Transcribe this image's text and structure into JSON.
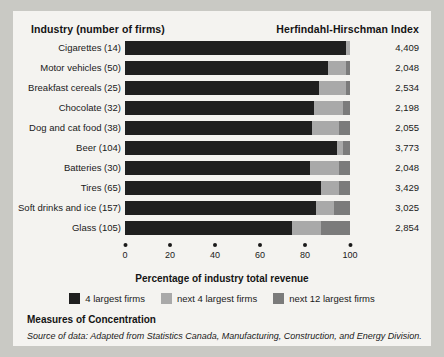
{
  "header": {
    "industry_label": "Industry (number of firms)",
    "hhi_label": "Herfindahl-Hirschman Index"
  },
  "axis": {
    "title": "Percentage of industry total revenue",
    "ticks": [
      "0",
      "20",
      "40",
      "60",
      "80",
      "100"
    ]
  },
  "legend": [
    {
      "label": "4 largest firms",
      "color": "#1f1f1f"
    },
    {
      "label": "next 4 largest firms",
      "color": "#a9a9a9"
    },
    {
      "label": "next 12 largest firms",
      "color": "#7b7b7b"
    }
  ],
  "footer": {
    "caption": "Measures of Concentration",
    "source": "Source of data: Adapted from Statistics Canada, Manufacturing, Construction, and Energy Division."
  },
  "chart_data": {
    "type": "bar",
    "title": "Measures of Concentration",
    "xlabel": "Percentage of industry total revenue",
    "ylabel": "Industry (number of firms)",
    "xlim": [
      0,
      100
    ],
    "grid": false,
    "orientation": "horizontal",
    "stacked": true,
    "legend_position": "bottom",
    "categories": [
      "Cigarettes (14)",
      "Motor vehicles (50)",
      "Breakfast cereals (25)",
      "Chocolate (32)",
      "Dog and cat food (38)",
      "Beer (104)",
      "Batteries (30)",
      "Tires (65)",
      "Soft drinks and ice (157)",
      "Glass (105)"
    ],
    "series": [
      {
        "name": "4 largest firms",
        "values": [
          98,
          90,
          86,
          84,
          83,
          94,
          82,
          87,
          85,
          74
        ]
      },
      {
        "name": "next 4 largest firms",
        "values": [
          2,
          8,
          12,
          13,
          12,
          3,
          13,
          8,
          8,
          13
        ]
      },
      {
        "name": "next 12 largest firms",
        "values": [
          0,
          2,
          2,
          3,
          5,
          3,
          5,
          5,
          7,
          13
        ]
      }
    ],
    "annotations": {
      "hhi_column_header": "Herfindahl-Hirschman Index",
      "hhi_values": [
        "4,409",
        "2,048",
        "2,534",
        "2,198",
        "2,055",
        "3,773",
        "2,048",
        "3,429",
        "3,025",
        "2,854"
      ]
    }
  }
}
